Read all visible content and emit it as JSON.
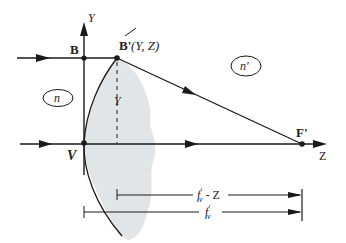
{
  "diagram": {
    "colors": {
      "stroke": "#1a1a1a",
      "shading": "#dfe3e6",
      "background": "#ffffff"
    },
    "labels": {
      "y_axis": "Y",
      "z_axis": "Z",
      "point_b": "B",
      "point_b_prime": "B'",
      "point_b_prime_coords": "(Y, Z)",
      "vertex": "V",
      "focal_point": "F'",
      "medium_left": "n",
      "medium_right": "n'",
      "height_label": "Y",
      "dim_short": "f'v - Z",
      "dim_short_main": "f",
      "dim_short_sup": "'",
      "dim_short_sub": "v",
      "dim_short_tail": " - Z",
      "dim_long_main": "f",
      "dim_long_sup": "'",
      "dim_long_sub": "v"
    },
    "points": {
      "B": [
        84,
        58
      ],
      "B_prime": [
        117,
        58
      ],
      "V": [
        84,
        143
      ],
      "F_prime": [
        302,
        144
      ]
    }
  }
}
